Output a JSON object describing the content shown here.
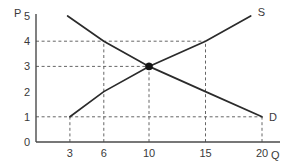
{
  "chart_data": {
    "type": "line",
    "title": "",
    "subtitle": "",
    "xlabel": "Q",
    "ylabel": "P",
    "xlim": [
      0,
      22
    ],
    "ylim": [
      0,
      5.4
    ],
    "grid": false,
    "grid_style": "dashed-guides",
    "legend_position": "curve-end-labels",
    "x_ticks": [
      {
        "value": 3,
        "label": "3"
      },
      {
        "value": 6,
        "label": "6"
      },
      {
        "value": 10,
        "label": "10"
      },
      {
        "value": 15,
        "label": "15"
      },
      {
        "value": 20,
        "label": "20"
      }
    ],
    "y_ticks": [
      {
        "value": 0,
        "label": "0"
      },
      {
        "value": 1,
        "label": "1"
      },
      {
        "value": 2,
        "label": "2"
      },
      {
        "value": 3,
        "label": "3"
      },
      {
        "value": 4,
        "label": "4"
      },
      {
        "value": 5,
        "label": "5"
      }
    ],
    "series": [
      {
        "name": "D",
        "label": "D",
        "description": "demand curve",
        "points": [
          [
            2.8,
            5
          ],
          [
            6,
            4
          ],
          [
            10,
            3
          ],
          [
            15,
            2
          ],
          [
            20,
            1
          ]
        ]
      },
      {
        "name": "S",
        "label": "S",
        "description": "supply curve",
        "points": [
          [
            3,
            1
          ],
          [
            6,
            2
          ],
          [
            10,
            3
          ],
          [
            15,
            4
          ],
          [
            19,
            5
          ]
        ]
      }
    ],
    "annotations": [
      {
        "name": "equilibrium-point",
        "kind": "point",
        "x": 10,
        "y": 3,
        "label": ""
      }
    ],
    "guides": {
      "horizontal": [
        {
          "y": 4,
          "x_from": 0,
          "x_to": 15
        },
        {
          "y": 3,
          "x_from": 0,
          "x_to": 10
        },
        {
          "y": 1,
          "x_from": 0,
          "x_to": 20
        }
      ],
      "vertical": [
        {
          "x": 3,
          "y_from": 0,
          "y_to": 1
        },
        {
          "x": 6,
          "y_from": 0,
          "y_to": 4
        },
        {
          "x": 10,
          "y_from": 0,
          "y_to": 3
        },
        {
          "x": 15,
          "y_from": 0,
          "y_to": 4
        },
        {
          "x": 20,
          "y_from": 0,
          "y_to": 1
        }
      ]
    },
    "colors": {
      "background": "#ffffff",
      "axis": "#4a4a4a",
      "curve": "#2b2b2b",
      "guide": "#555555",
      "point": "#141414",
      "text": "#3a3a3a"
    }
  }
}
